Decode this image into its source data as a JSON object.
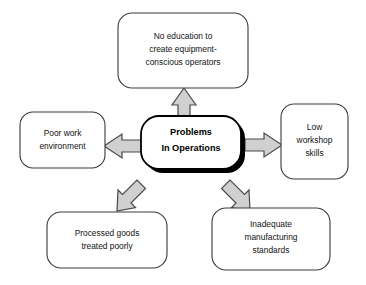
{
  "diagram": {
    "type": "hub-and-spoke",
    "title_node": {
      "id": "center",
      "name": "problems-in-operations",
      "lines": [
        "Problems",
        "In Operations"
      ],
      "text": "Problems In Operations",
      "bold": true,
      "has_shadow": true,
      "shadow_color": "#000000",
      "fill": "#ffffff",
      "stroke": "#000000"
    },
    "nodes": [
      {
        "id": "top",
        "name": "no-education-node",
        "position": "top",
        "lines": [
          "No education to",
          "create equipment-",
          "conscious operators"
        ],
        "text": "No education to create equipment-conscious operators",
        "fill": "#ffffff",
        "stroke": "#3a3a3a"
      },
      {
        "id": "left",
        "name": "poor-work-environment-node",
        "position": "left",
        "lines": [
          "Poor work",
          "environment"
        ],
        "text": "Poor work environment",
        "fill": "#ffffff",
        "stroke": "#3a3a3a"
      },
      {
        "id": "right",
        "name": "low-workshop-skills-node",
        "position": "right",
        "lines": [
          "Low",
          "workshop",
          "skills"
        ],
        "text": "Low workshop skills",
        "fill": "#ffffff",
        "stroke": "#3a3a3a"
      },
      {
        "id": "bottom-left",
        "name": "processed-goods-node",
        "position": "bottom-left",
        "lines": [
          "Processed goods",
          "treated poorly"
        ],
        "text": "Processed goods treated poorly",
        "fill": "#ffffff",
        "stroke": "#3a3a3a"
      },
      {
        "id": "bottom-right",
        "name": "inadequate-standards-node",
        "position": "bottom-right",
        "lines": [
          "Inadequate",
          "manufacturing",
          "standards"
        ],
        "text": "Inadequate manufacturing standards",
        "fill": "#ffffff",
        "stroke": "#3a3a3a"
      }
    ],
    "arrows": [
      {
        "id": "arrow-up",
        "name": "arrow-up-icon",
        "direction": "up",
        "from": "center",
        "to": "top",
        "fill": "#d0d0d0",
        "stroke": "#4a4a4a"
      },
      {
        "id": "arrow-left",
        "name": "arrow-left-icon",
        "direction": "left",
        "from": "center",
        "to": "left",
        "fill": "#d0d0d0",
        "stroke": "#4a4a4a"
      },
      {
        "id": "arrow-right",
        "name": "arrow-right-icon",
        "direction": "right",
        "from": "center",
        "to": "right",
        "fill": "#d0d0d0",
        "stroke": "#4a4a4a"
      },
      {
        "id": "arrow-down-left",
        "name": "arrow-down-left-icon",
        "direction": "down-left",
        "from": "center",
        "to": "bottom-left",
        "fill": "#d0d0d0",
        "stroke": "#4a4a4a"
      },
      {
        "id": "arrow-down-right",
        "name": "arrow-down-right-icon",
        "direction": "down-right",
        "from": "center",
        "to": "bottom-right",
        "fill": "#d0d0d0",
        "stroke": "#4a4a4a"
      }
    ],
    "background": "#ffffff"
  }
}
